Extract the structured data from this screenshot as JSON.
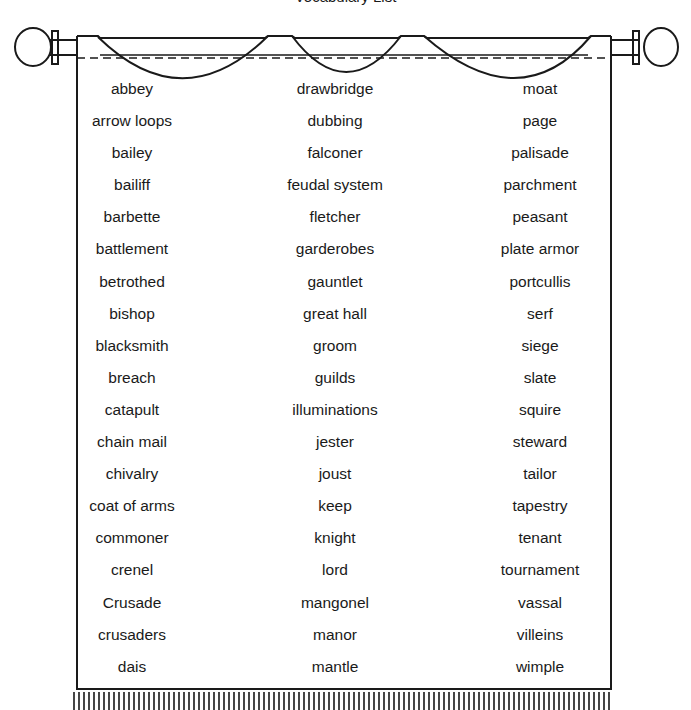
{
  "page": {
    "title_clipped": "Vocabulary List"
  },
  "banner": {
    "style": "hanging tapestry banner on a rod with fringe",
    "colors": {
      "ink": "#1a1a1a",
      "paper": "#ffffff"
    }
  },
  "word_list": {
    "columns": [
      {
        "words": [
          "abbey",
          "arrow loops",
          "bailey",
          "bailiff",
          "barbette",
          "battlement",
          "betrothed",
          "bishop",
          "blacksmith",
          "breach",
          "catapult",
          "chain mail",
          "chivalry",
          "coat of arms",
          "commoner",
          "crenel",
          "Crusade",
          "crusaders",
          "dais"
        ]
      },
      {
        "words": [
          "drawbridge",
          "dubbing",
          "falconer",
          "feudal system",
          "fletcher",
          "garderobes",
          "gauntlet",
          "great hall",
          "groom",
          "guilds",
          "illuminations",
          "jester",
          "joust",
          "keep",
          "knight",
          "lord",
          "mangonel",
          "manor",
          "mantle"
        ]
      },
      {
        "words": [
          "moat",
          "page",
          "palisade",
          "parchment",
          "peasant",
          "plate armor",
          "portcullis",
          "serf",
          "siege",
          "slate",
          "squire",
          "steward",
          "tailor",
          "tapestry",
          "tenant",
          "tournament",
          "vassal",
          "villeins",
          "wimple"
        ]
      }
    ]
  }
}
